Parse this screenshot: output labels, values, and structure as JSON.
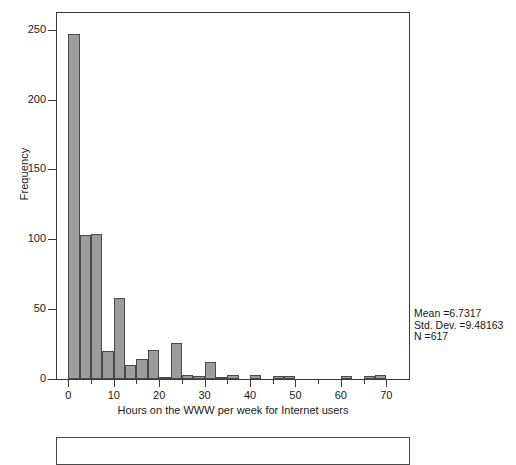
{
  "chart_data": {
    "type": "bar",
    "title": "",
    "subtitle": "",
    "xlabel": "Hours on the WWW per week for Internet users",
    "ylabel": "Frequency",
    "xlim": [
      -2.5,
      75
    ],
    "ylim": [
      0,
      262
    ],
    "grid": false,
    "legend": null,
    "xticks": [
      0,
      10,
      20,
      30,
      40,
      50,
      60,
      70
    ],
    "xticklabels": [
      "0",
      "10",
      "20",
      "30",
      "40",
      "50",
      "60",
      "70"
    ],
    "xminorticks": [
      5,
      15,
      25,
      35,
      45,
      55,
      65
    ],
    "yticks": [
      0,
      50,
      100,
      150,
      200,
      250
    ],
    "yticklabels": [
      "0",
      "50",
      "100",
      "150",
      "200",
      "250"
    ],
    "bin_width": 2.5,
    "bin_starts": [
      0,
      2.5,
      5,
      7.5,
      10,
      12.5,
      15,
      17.5,
      20,
      22.5,
      25,
      27.5,
      30,
      32.5,
      35,
      37.5,
      40,
      42.5,
      45,
      47.5,
      50,
      52.5,
      55,
      57.5,
      60,
      62.5,
      65,
      67.5,
      70
    ],
    "values": [
      247,
      103,
      104,
      20,
      58,
      10,
      14,
      21,
      1,
      26,
      3,
      2,
      12,
      1,
      3,
      0,
      3,
      0,
      2,
      2,
      0,
      0,
      0,
      0,
      2,
      0,
      2,
      3,
      0
    ],
    "bar_color": "#9c9c9c",
    "bar_edge_color": "#4a4a4a",
    "annotations": {
      "mean_label": "Mean =6.7317",
      "std_label": "Std. Dev. =9.48163",
      "n_label": "N =617",
      "mean": 6.7317,
      "std_dev": 9.48163,
      "n": 617
    }
  },
  "figure": {
    "ylabel": "Frequency",
    "xlabel": "Hours on the WWW per week for Internet users"
  },
  "stats": {
    "mean": "Mean =6.7317",
    "std": "Std. Dev. =9.48163",
    "n": "N =617"
  }
}
